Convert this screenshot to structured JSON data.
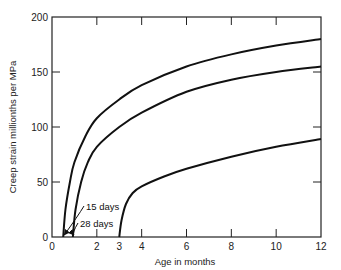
{
  "chart_data": {
    "type": "line",
    "title": "",
    "xlabel": "Age in months",
    "ylabel": "Creep strain millionths per MPa",
    "xlim": [
      0,
      12
    ],
    "ylim": [
      0,
      200
    ],
    "x_ticks": [
      0,
      2,
      3,
      4,
      6,
      8,
      10,
      12
    ],
    "x_tick_labels": [
      "0",
      "2",
      "3",
      "4",
      "6",
      "8",
      "10",
      "12"
    ],
    "y_ticks": [
      0,
      50,
      100,
      150,
      200
    ],
    "y_tick_labels": [
      "0",
      "50",
      "100",
      "150",
      "200"
    ],
    "grid": false,
    "legend": "none (curves annotated directly)",
    "series": [
      {
        "name": "15 days",
        "x": [
          0.5,
          0.6,
          0.8,
          1.0,
          1.5,
          2,
          3,
          4,
          6,
          8,
          10,
          12
        ],
        "values": [
          0,
          25,
          50,
          68,
          92,
          108,
          125,
          138,
          155,
          166,
          174,
          180
        ]
      },
      {
        "name": "28 days",
        "x": [
          0.93,
          1.05,
          1.3,
          1.6,
          2,
          3,
          4,
          6,
          8,
          10,
          12
        ],
        "values": [
          0,
          25,
          50,
          68,
          82,
          100,
          113,
          132,
          143,
          150,
          155
        ]
      },
      {
        "name": "3 months",
        "x": [
          3,
          3.1,
          3.3,
          3.6,
          4,
          5,
          6,
          8,
          10,
          12
        ],
        "values": [
          0,
          15,
          30,
          40,
          46,
          55,
          62,
          73,
          82,
          89
        ]
      }
    ],
    "annotations": [
      {
        "text": "15 days",
        "points_to_x": 0.5
      },
      {
        "text": "28 days",
        "points_to_x": 0.93
      }
    ]
  }
}
